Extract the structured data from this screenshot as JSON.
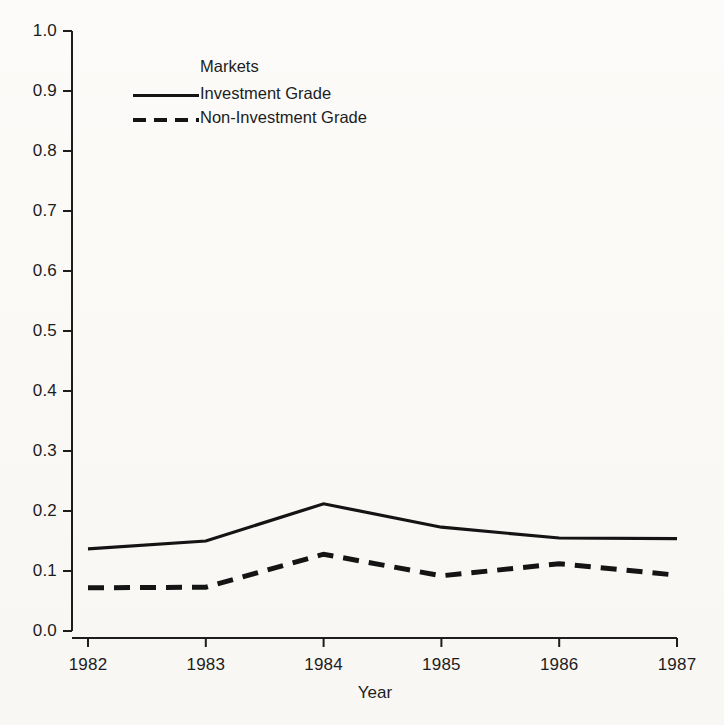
{
  "chart_data": {
    "type": "line",
    "title": "",
    "xlabel": "Year",
    "ylabel": "",
    "x": [
      1982,
      1983,
      1984,
      1985,
      1986,
      1987
    ],
    "xtick_labels": [
      "1982",
      "1983",
      "1984",
      "1985",
      "1986",
      "1987"
    ],
    "ytick_labels": [
      "0.0",
      "0.1",
      "0.2",
      "0.3",
      "0.4",
      "0.5",
      "0.6",
      "0.7",
      "0.8",
      "0.9",
      "1.0"
    ],
    "ytick_values": [
      0.0,
      0.1,
      0.2,
      0.3,
      0.4,
      0.5,
      0.6,
      0.7,
      0.8,
      0.9,
      1.0
    ],
    "xlim": [
      1982,
      1987
    ],
    "ylim": [
      0.0,
      1.0
    ],
    "grid": false,
    "legend_position": "upper-left-inside",
    "legend_title": "Markets",
    "series": [
      {
        "name": "Investment Grade",
        "style": "solid",
        "color": "#141414",
        "values": [
          0.137,
          0.15,
          0.212,
          0.173,
          0.155,
          0.154
        ]
      },
      {
        "name": "Non-Investment Grade",
        "style": "dashed",
        "color": "#141414",
        "values": [
          0.072,
          0.073,
          0.128,
          0.092,
          0.112,
          0.093
        ]
      }
    ]
  },
  "axis": {
    "x_title": "Year"
  },
  "legend": {
    "title": "Markets",
    "entries": [
      {
        "label": "Investment Grade",
        "style": "solid"
      },
      {
        "label": "Non-Investment Grade",
        "style": "dashed"
      }
    ]
  }
}
